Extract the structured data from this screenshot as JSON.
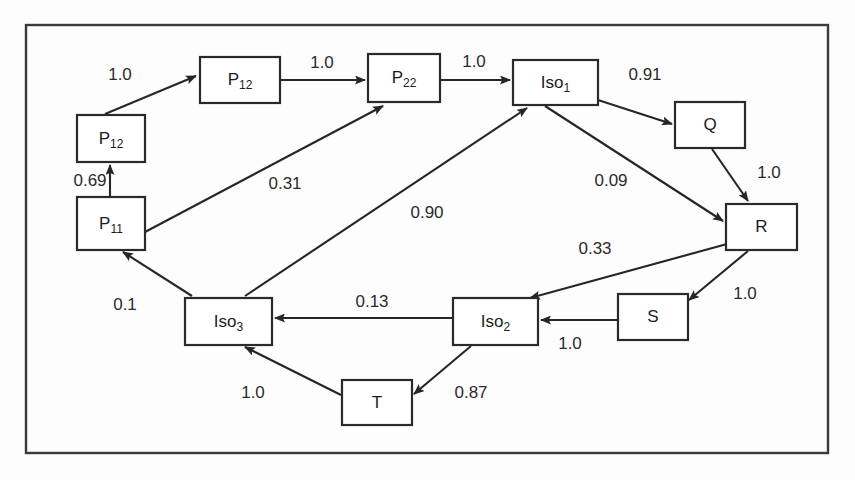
{
  "diagram": {
    "frame": {
      "x": 26,
      "y": 25,
      "width": 802,
      "height": 428
    },
    "colors": {
      "stroke": "#262626",
      "box_stroke": "#2a2a2a",
      "frame_stroke": "#3a3a3a",
      "text": "#1c1c1c",
      "background": "#fdfdfd"
    },
    "nodes": [
      {
        "id": "p12_top",
        "label": "P",
        "sub": "12",
        "x": 200,
        "y": 57,
        "w": 80,
        "h": 46
      },
      {
        "id": "p12_left",
        "label": "P",
        "sub": "12",
        "x": 77,
        "y": 115,
        "w": 68,
        "h": 47
      },
      {
        "id": "p11",
        "label": "P",
        "sub": "11",
        "x": 77,
        "y": 197,
        "w": 68,
        "h": 53
      },
      {
        "id": "p22",
        "label": "P",
        "sub": "22",
        "x": 368,
        "y": 54,
        "w": 72,
        "h": 48
      },
      {
        "id": "iso1",
        "label": "Iso",
        "sub": "1",
        "x": 513,
        "y": 60,
        "w": 85,
        "h": 45
      },
      {
        "id": "q",
        "label": "Q",
        "sub": "",
        "x": 675,
        "y": 102,
        "w": 70,
        "h": 46
      },
      {
        "id": "r",
        "label": "R",
        "sub": "",
        "x": 726,
        "y": 204,
        "w": 71,
        "h": 46
      },
      {
        "id": "s",
        "label": "S",
        "sub": "",
        "x": 618,
        "y": 294,
        "w": 70,
        "h": 46
      },
      {
        "id": "iso2",
        "label": "Iso",
        "sub": "2",
        "x": 453,
        "y": 298,
        "w": 85,
        "h": 47
      },
      {
        "id": "iso3",
        "label": "Iso",
        "sub": "3",
        "x": 185,
        "y": 298,
        "w": 87,
        "h": 47
      },
      {
        "id": "t",
        "label": "T",
        "sub": "",
        "x": 342,
        "y": 380,
        "w": 70,
        "h": 45
      }
    ],
    "edges": [
      {
        "id": "e1",
        "from": "p12_left",
        "to": "p12_top",
        "weight": "1.0",
        "label_x": 120,
        "label_y": 76,
        "x1": 105,
        "y1": 114,
        "x2": 196,
        "y2": 76
      },
      {
        "id": "e2",
        "from": "p12_top",
        "to": "p22",
        "weight": "1.0",
        "label_x": 322,
        "label_y": 64,
        "x1": 281,
        "y1": 80,
        "x2": 365,
        "y2": 80
      },
      {
        "id": "e3",
        "from": "p22",
        "to": "iso1",
        "weight": "1.0",
        "label_x": 474,
        "label_y": 63,
        "x1": 441,
        "y1": 80,
        "x2": 510,
        "y2": 80
      },
      {
        "id": "e4",
        "from": "iso1",
        "to": "q",
        "weight": "0.91",
        "label_x": 645,
        "label_y": 76,
        "x1": 598,
        "y1": 100,
        "x2": 672,
        "y2": 124
      },
      {
        "id": "e5",
        "from": "q",
        "to": "r",
        "weight": "1.0",
        "label_x": 769,
        "label_y": 174,
        "x1": 712,
        "y1": 149,
        "x2": 748,
        "y2": 201
      },
      {
        "id": "e6",
        "from": "iso1",
        "to": "r",
        "weight": "0.09",
        "label_x": 611,
        "label_y": 182,
        "x1": 545,
        "y1": 106,
        "x2": 723,
        "y2": 221
      },
      {
        "id": "e7",
        "from": "p11",
        "to": "p12_left",
        "weight": "0.69",
        "label_x": 90,
        "label_y": 182,
        "x1": 110,
        "y1": 196,
        "x2": 110,
        "y2": 165
      },
      {
        "id": "e8",
        "from": "p11",
        "to": "p22",
        "weight": "0.31",
        "label_x": 285,
        "label_y": 185,
        "x1": 145,
        "y1": 232,
        "x2": 383,
        "y2": 106
      },
      {
        "id": "e9",
        "from": "iso3",
        "to": "iso1",
        "weight": "0.90",
        "label_x": 427,
        "label_y": 214,
        "x1": 245,
        "y1": 296,
        "x2": 527,
        "y2": 108
      },
      {
        "id": "e10",
        "from": "r",
        "to": "iso2",
        "weight": "0.33",
        "label_x": 595,
        "label_y": 250,
        "x1": 727,
        "y1": 244,
        "x2": 530,
        "y2": 298
      },
      {
        "id": "e11",
        "from": "r",
        "to": "s",
        "weight": "1.0",
        "label_x": 745,
        "label_y": 295,
        "x1": 748,
        "y1": 251,
        "x2": 689,
        "y2": 300
      },
      {
        "id": "e12",
        "from": "s",
        "to": "iso2",
        "weight": "1.0",
        "label_x": 570,
        "label_y": 345,
        "x1": 617,
        "y1": 320,
        "x2": 541,
        "y2": 320
      },
      {
        "id": "e13",
        "from": "iso2",
        "to": "iso3",
        "weight": "0.13",
        "label_x": 372,
        "label_y": 303,
        "x1": 452,
        "y1": 318,
        "x2": 275,
        "y2": 318
      },
      {
        "id": "e14",
        "from": "iso2",
        "to": "t",
        "weight": "0.87",
        "label_x": 471,
        "label_y": 394,
        "x1": 471,
        "y1": 346,
        "x2": 414,
        "y2": 394
      },
      {
        "id": "e15",
        "from": "t",
        "to": "iso3",
        "weight": "1.0",
        "label_x": 253,
        "label_y": 394,
        "x1": 341,
        "y1": 395,
        "x2": 245,
        "y2": 347
      },
      {
        "id": "e16",
        "from": "iso3",
        "to": "p11",
        "weight": "0.1",
        "label_x": 125,
        "label_y": 306,
        "x1": 192,
        "y1": 296,
        "x2": 123,
        "y2": 252
      }
    ]
  }
}
